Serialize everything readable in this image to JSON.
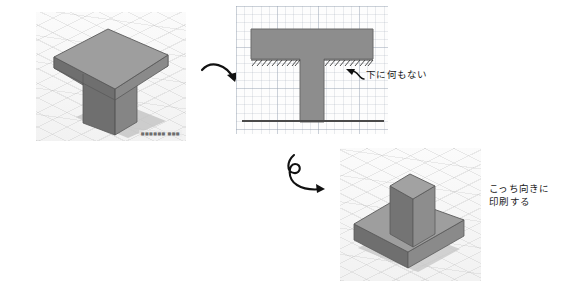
{
  "page": {
    "background_color": "#ffffff",
    "width": 580,
    "height": 295
  },
  "palette": {
    "model_top": "#9c9c9c",
    "model_front": "#8a8a8a",
    "model_side": "#767676",
    "model_dark": "#6e6e6e",
    "outline": "#5a5a5a",
    "shadow": "#c9c9c9",
    "ink": "#1a1a1a",
    "section_fill": "#8d8d8d",
    "section_outline": "#6b6b6b",
    "ground_line": "#4a4a4a",
    "grid_paper": "#8d9aad"
  },
  "panels": {
    "original_model": {
      "name": "original-3d-model-viewport",
      "caption_watermark": "■■■■■■ ■■■",
      "description": "T-shaped block, flange on top, web below (overhang present)"
    },
    "cross_section": {
      "name": "cross-section-sketch",
      "description": "Front view of T profile on grid paper with overhang hatching and ground line",
      "hatch_label": "overhang-hatching",
      "ground_label": "build-plate-line"
    },
    "flipped_model": {
      "name": "flipped-3d-model-viewport",
      "description": "T-shape rotated so flange is flat on the build plate, web pointing up"
    }
  },
  "annotations": {
    "overhang_note": "下に何もない",
    "print_orientation_note": "こっち向きに\n印刷する"
  },
  "arrows": {
    "transform_arrow": "curved-arrow-right",
    "rotate_arrow": "loop-rotate-arrow"
  }
}
